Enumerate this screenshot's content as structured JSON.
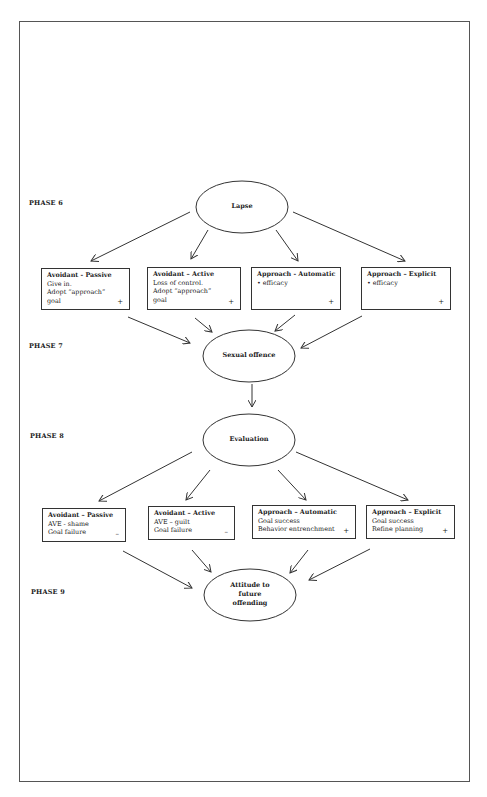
{
  "diagram": {
    "phases": [
      {
        "id": "phase6",
        "label": "PHASE 6"
      },
      {
        "id": "phase7",
        "label": "PHASE 7"
      },
      {
        "id": "phase8",
        "label": "PHASE 8"
      },
      {
        "id": "phase9",
        "label": "PHASE 9"
      }
    ],
    "nodes": {
      "lapse": {
        "label": "Lapse"
      },
      "sexual_offence": {
        "label": "Sexual offence"
      },
      "evaluation": {
        "label": "Evaluation"
      },
      "attitude": {
        "lines": [
          "Attitude to",
          "future",
          "offending"
        ]
      }
    },
    "phase6_boxes": [
      {
        "title": "Avoidant - Passive",
        "lines": [
          "Give in.",
          "Adopt “approach”",
          "goal"
        ],
        "sign": "+"
      },
      {
        "title": "Avoidant – Active",
        "lines": [
          "Loss of control.",
          "Adopt “approach”",
          "goal"
        ],
        "sign": "+"
      },
      {
        "title": "Approach - Automatic",
        "lines": [
          "•  efficacy"
        ],
        "sign": "+"
      },
      {
        "title": "Approach – Explicit",
        "lines": [
          "• efficacy"
        ],
        "sign": "+"
      }
    ],
    "phase8_boxes": [
      {
        "title": "Avoidant – Passive",
        "lines": [
          "AVE - shame",
          "Goal failure"
        ],
        "sign": "–"
      },
      {
        "title": "Avoidant – Active",
        "lines": [
          "AVE – guilt",
          "Goal failure"
        ],
        "sign": "–"
      },
      {
        "title": "Approach – Automatic",
        "lines": [
          "Goal success",
          "Behavior entrenchment"
        ],
        "sign": "+"
      },
      {
        "title": "Approach – Explicit",
        "lines": [
          "Goal success",
          "Refine planning"
        ],
        "sign": "+"
      }
    ],
    "colors": {
      "line": "#333333",
      "background": "#ffffff"
    }
  }
}
